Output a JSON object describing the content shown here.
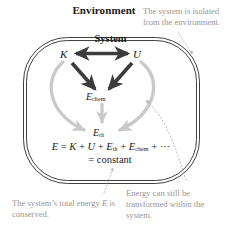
{
  "diagram": {
    "environment_label": "Environment",
    "system_label": "System",
    "symbols": {
      "kinetic": "K",
      "potential": "U",
      "chemical_base": "E",
      "chemical_sub": "chem",
      "thermal_base": "E",
      "thermal_sub": "th"
    },
    "equation": {
      "line1_parts": {
        "e": "E",
        "eq": " = ",
        "k": "K",
        "plus1": " + ",
        "u": "U",
        "plus2": " + ",
        "eth_base": "E",
        "eth_sub": "th",
        "plus3": " + ",
        "echem_base": "E",
        "echem_sub": "chem",
        "plus4": " + ",
        "ellipsis": "···"
      },
      "line1_text": "E = K + U + E th + E chem + ···",
      "line2": "= constant"
    },
    "annotations": {
      "isolated": "The system is isolated from the environment.",
      "conserved_before": "The system’s total energy ",
      "conserved_italic": "E",
      "conserved_after": " is conserved.",
      "conserved_full": "The system’s total energy E is conserved.",
      "transformed": "Energy can still be transformed within the system."
    },
    "colors": {
      "boundary": "#2b2b2b",
      "dark_arrow": "#3c3c3c",
      "light_arrow": "#c9c9c9",
      "annotation_text": "#9b958f",
      "leader_line": "#b9b3ad",
      "background": "#ffffff",
      "text": "#1a1a1a"
    },
    "arrows": {
      "k_u_exchange": "double-headed arrow between K and U",
      "k_to_echem": "arrow from K down to E chem",
      "u_to_echem": "arrow from U down to E chem",
      "echem_to_eth": "arrow from E chem down to E th",
      "k_curve_to_eth": "curved arrow from K around to E th",
      "u_curve_to_eth": "curved arrow from U around to E th"
    }
  }
}
